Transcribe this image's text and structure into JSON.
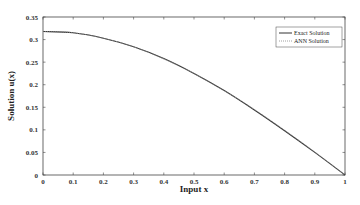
{
  "chart_data": {
    "type": "line",
    "title": "",
    "xlabel": "Input x",
    "ylabel": "Solution u(x)",
    "xlim": [
      0,
      1
    ],
    "ylim": [
      0,
      0.35
    ],
    "xticks": [
      "0",
      "0.1",
      "0.2",
      "0.3",
      "0.4",
      "0.5",
      "0.6",
      "0.7",
      "0.8",
      "0.9",
      "1"
    ],
    "yticks": [
      "0",
      "0.05",
      "0.1",
      "0.15",
      "0.2",
      "0.25",
      "0.3",
      "0.35"
    ],
    "grid": false,
    "legend_position": "upper right",
    "x": [
      0,
      0.1,
      0.2,
      0.3,
      0.4,
      0.5,
      0.6,
      0.7,
      0.8,
      0.9,
      1.0
    ],
    "series": [
      {
        "name": "Exact Solution",
        "style": "solid",
        "color": "#333333",
        "values": [
          0.318,
          0.315,
          0.303,
          0.284,
          0.258,
          0.225,
          0.187,
          0.144,
          0.098,
          0.05,
          0.0
        ]
      },
      {
        "name": "ANN Solution",
        "style": "dotted",
        "color": "#888888",
        "values": [
          0.318,
          0.315,
          0.303,
          0.284,
          0.257,
          0.225,
          0.187,
          0.145,
          0.099,
          0.051,
          0.0
        ]
      }
    ]
  }
}
